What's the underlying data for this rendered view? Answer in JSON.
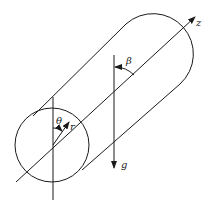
{
  "diagram": {
    "type": "cylinder-coordinate-sketch",
    "labels": {
      "z": "z",
      "beta": "β",
      "theta": "θ",
      "r": "r",
      "g": "g"
    },
    "colors": {
      "stroke": "#1a1a1a",
      "background": "#ffffff"
    }
  }
}
